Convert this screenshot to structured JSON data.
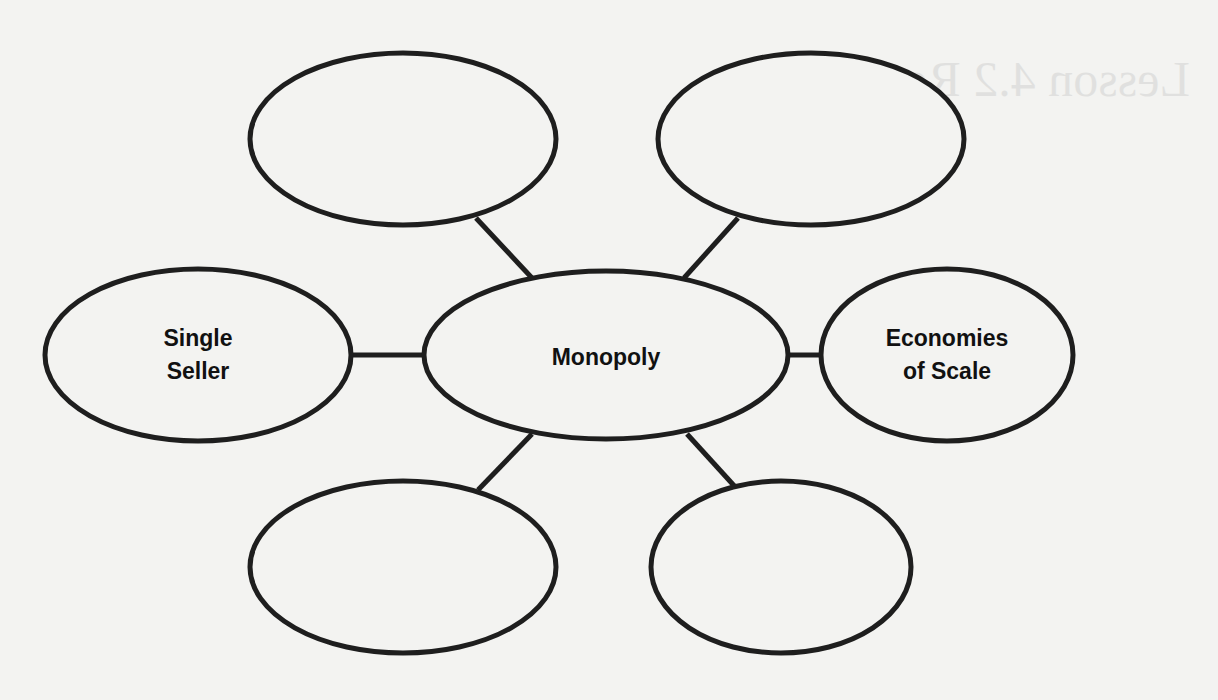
{
  "diagram": {
    "type": "concept-map",
    "center": {
      "label": "Monopoly"
    },
    "nodes": [
      {
        "id": "top-left",
        "label": ""
      },
      {
        "id": "top-right",
        "label": ""
      },
      {
        "id": "left",
        "label_line1": "Single",
        "label_line2": "Seller"
      },
      {
        "id": "right",
        "label_line1": "Economies",
        "label_line2": "of Scale"
      },
      {
        "id": "bottom-left",
        "label": ""
      },
      {
        "id": "bottom-right",
        "label": ""
      }
    ],
    "stroke_color": "#1e1e1e",
    "background_color": "#f3f3f1"
  },
  "bleed_through": {
    "title": "Lesson 4.2 Reading",
    "lines": [
      "Key Terms",
      "monopoly",
      "economies of scale",
      "natural monopoly",
      "government monopoly",
      "patent",
      "Academic Vocabulary"
    ]
  }
}
